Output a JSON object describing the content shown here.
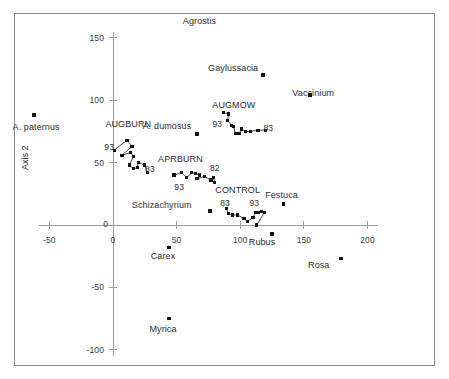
{
  "axes": {
    "y_title": "Axis 2",
    "x_ticks": [
      -50,
      0,
      50,
      100,
      150,
      200
    ],
    "y_ticks": [
      -100,
      -50,
      0,
      50,
      100,
      150
    ],
    "x_tick_labels": [
      "-50",
      "0",
      "50",
      "100",
      "150",
      "200"
    ],
    "y_tick_labels": [
      "-100",
      "-50",
      "0",
      "50",
      "100",
      "150"
    ]
  },
  "chart_data": {
    "type": "scatter",
    "title": "",
    "subtitle": "",
    "xlabel": "",
    "ylabel": "Axis 2",
    "xlim": [
      -75,
      215
    ],
    "ylim": [
      -115,
      165
    ],
    "grid": false,
    "legend": "none",
    "axis_style": "crossed-axes-at-origin",
    "species_points": [
      {
        "name": "A. paternus",
        "x": -62,
        "y": 88,
        "label_dx": 2,
        "label_dy": 13
      },
      {
        "name": "Agrostis",
        "x": 68,
        "y": 163,
        "label_dx": 0,
        "label_dy": 0,
        "point_visible": false
      },
      {
        "name": "Gaylussacia",
        "x": 118,
        "y": 120,
        "label_dx": -30,
        "label_dy": -6
      },
      {
        "name": "Vaccinium",
        "x": 155,
        "y": 104,
        "label_dx": 3,
        "label_dy": -1
      },
      {
        "name": "A. dumosus",
        "x": 66,
        "y": 73,
        "label_dx": -30,
        "label_dy": -7
      },
      {
        "name": "Festuca",
        "x": 134,
        "y": 17,
        "label_dx": -2,
        "label_dy": -8
      },
      {
        "name": "Schizachyrium",
        "x": 76,
        "y": 11,
        "label_dx": -48,
        "label_dy": -5
      },
      {
        "name": "Rubus",
        "x": 125,
        "y": -7,
        "label_dx": -10,
        "label_dy": 9
      },
      {
        "name": "Carex",
        "x": 44,
        "y": -18,
        "label_dx": -6,
        "label_dy": 10
      },
      {
        "name": "Rosa",
        "x": 179,
        "y": -27,
        "label_dx": -22,
        "label_dy": 7
      },
      {
        "name": "Myrica",
        "x": 44,
        "y": -75,
        "label_dx": -6,
        "label_dy": 11
      }
    ],
    "trajectories": [
      {
        "name": "AUGBURN",
        "label": "AUGBURN",
        "label_x": 12,
        "label_y": 80,
        "start_year": "93",
        "end_year": "83",
        "start_year_x": -3,
        "start_year_y": 62,
        "end_year_x": 29,
        "end_year_y": 44,
        "points": [
          {
            "x": 1,
            "y": 60
          },
          {
            "x": 11,
            "y": 68
          },
          {
            "x": 15,
            "y": 63
          },
          {
            "x": 7,
            "y": 56
          },
          {
            "x": 14,
            "y": 58
          },
          {
            "x": 16,
            "y": 55
          },
          {
            "x": 13,
            "y": 48
          },
          {
            "x": 16,
            "y": 45
          },
          {
            "x": 19,
            "y": 46
          },
          {
            "x": 20,
            "y": 50
          },
          {
            "x": 25,
            "y": 48
          },
          {
            "x": 27,
            "y": 42
          }
        ]
      },
      {
        "name": "APRBURN",
        "label": "APRBURN",
        "label_x": 53,
        "label_y": 52,
        "start_year": "93",
        "end_year": "82",
        "start_year_x": 52,
        "start_year_y": 30,
        "end_year_x": 80,
        "end_year_y": 45,
        "points": [
          {
            "x": 48,
            "y": 40
          },
          {
            "x": 54,
            "y": 42
          },
          {
            "x": 58,
            "y": 38
          },
          {
            "x": 62,
            "y": 42
          },
          {
            "x": 65,
            "y": 41
          },
          {
            "x": 68,
            "y": 40
          },
          {
            "x": 66,
            "y": 37
          },
          {
            "x": 72,
            "y": 39
          },
          {
            "x": 77,
            "y": 36
          },
          {
            "x": 79,
            "y": 38
          },
          {
            "x": 80,
            "y": 34
          }
        ]
      },
      {
        "name": "AUGMOW",
        "label": "AUGMOW",
        "label_x": 95,
        "label_y": 95,
        "start_year": "93",
        "end_year": "83",
        "start_year_x": 82,
        "start_year_y": 80,
        "end_year_x": 122,
        "end_year_y": 77,
        "points": [
          {
            "x": 87,
            "y": 90
          },
          {
            "x": 91,
            "y": 89
          },
          {
            "x": 90,
            "y": 84
          },
          {
            "x": 93,
            "y": 80
          },
          {
            "x": 95,
            "y": 79
          },
          {
            "x": 96,
            "y": 73
          },
          {
            "x": 99,
            "y": 73
          },
          {
            "x": 101,
            "y": 77
          },
          {
            "x": 104,
            "y": 75
          },
          {
            "x": 108,
            "y": 75
          },
          {
            "x": 114,
            "y": 76
          },
          {
            "x": 120,
            "y": 76
          }
        ]
      },
      {
        "name": "CONTROL",
        "label": "CONTROL",
        "label_x": 98,
        "label_y": 27,
        "start_year": "83",
        "end_year": "93",
        "start_year_x": 88,
        "start_year_y": 17,
        "end_year_x": 111,
        "end_year_y": 17,
        "points": [
          {
            "x": 89,
            "y": 13
          },
          {
            "x": 91,
            "y": 9
          },
          {
            "x": 94,
            "y": 8
          },
          {
            "x": 98,
            "y": 8
          },
          {
            "x": 103,
            "y": 5
          },
          {
            "x": 106,
            "y": 3
          },
          {
            "x": 110,
            "y": 6
          },
          {
            "x": 112,
            "y": 10
          },
          {
            "x": 114,
            "y": 10
          },
          {
            "x": 117,
            "y": 11
          },
          {
            "x": 119,
            "y": 10
          },
          {
            "x": 113,
            "y": 0
          }
        ]
      }
    ]
  },
  "colors": {
    "frame": "#8c8c8c",
    "axis": "#9a9a9a",
    "marker": "#111111",
    "trajectory_line": "#1a1a1a",
    "text": "#2b2b2b",
    "background": "#ffffff"
  }
}
